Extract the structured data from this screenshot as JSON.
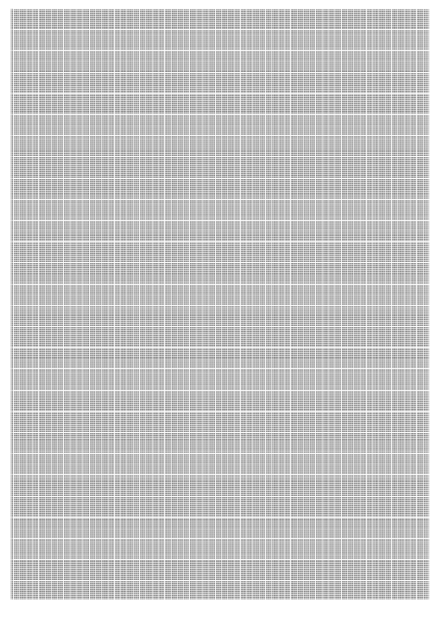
{
  "page": {
    "width": 439,
    "height": 618,
    "background_color": "#ffffff"
  },
  "sheet": {
    "margins": {
      "top": 8,
      "left": 10,
      "right": 9,
      "bottom": 18
    },
    "paper_color": "#ffffff"
  },
  "content_block": {
    "x": 10,
    "y": 8,
    "width": 420,
    "height": 592,
    "fill_color": "#9b9b9b",
    "rule_color": "#ffffff",
    "appearance": "dense tabular grid; rows and columns resolve only as texture"
  },
  "index_gutter": {
    "x": 10,
    "width": 3,
    "shade_color": "#6e6e6e"
  },
  "row_rules": {
    "start_y": 8,
    "spacing": 2.05,
    "count": 288,
    "opacity": 0.3
  },
  "band_rules": {
    "start_y": 8,
    "spacing": 21.2,
    "count": 28,
    "opacity": 0.85
  },
  "column_rules": {
    "start_x": 13,
    "spacing": 6.3,
    "count": 66,
    "major_every": 4,
    "opacity": 0.45,
    "major_opacity": 0.78
  }
}
